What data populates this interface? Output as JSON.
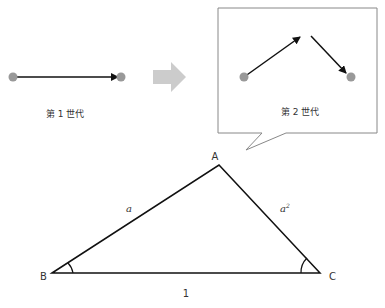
{
  "generation1": {
    "label": "第 1 世代"
  },
  "generation2": {
    "label": "第 2 世代"
  },
  "triangle": {
    "vertices": {
      "A": "A",
      "B": "B",
      "C": "C"
    },
    "sides": {
      "AB": "a",
      "AC_base": "a",
      "AC_exp": "2",
      "BC": "1"
    }
  },
  "colors": {
    "dot": "#999999",
    "line": "#111111",
    "big_arrow": "#cccccc",
    "callout_border": "#888888"
  }
}
